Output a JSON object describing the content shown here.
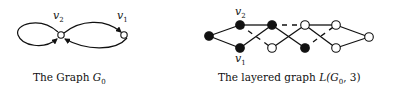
{
  "left_figure": {
    "caption_prefix": "The Graph ",
    "caption_math": "G",
    "caption_sub": "0",
    "nodes": [
      {
        "id": "v2",
        "label": "v",
        "sub": "2",
        "x": 61,
        "y": 35
      },
      {
        "id": "v1",
        "label": "v",
        "sub": "1",
        "x": 124,
        "y": 35
      }
    ],
    "edges": [
      {
        "from": "v2",
        "to": "v2",
        "type": "self-loop"
      },
      {
        "from": "v2",
        "to": "v1",
        "type": "arc-upper"
      },
      {
        "from": "v1",
        "to": "v2",
        "type": "arc-lower"
      }
    ]
  },
  "right_figure": {
    "caption_prefix": "The layered graph ",
    "caption_math": "L(G",
    "caption_sub": "0",
    "caption_suffix": ", 3)",
    "label_v2": {
      "label": "v",
      "sub": "2"
    },
    "label_v1": {
      "label": "v",
      "sub": "1"
    },
    "nodes": [
      {
        "id": "a",
        "x": 209,
        "y": 36,
        "filled": true
      },
      {
        "id": "b",
        "x": 240,
        "y": 25,
        "filled": true
      },
      {
        "id": "c",
        "x": 240,
        "y": 48,
        "filled": true
      },
      {
        "id": "d",
        "x": 272,
        "y": 25,
        "filled": true
      },
      {
        "id": "e",
        "x": 272,
        "y": 48,
        "filled": false
      },
      {
        "id": "f",
        "x": 305,
        "y": 25,
        "filled": false
      },
      {
        "id": "g",
        "x": 305,
        "y": 48,
        "filled": true
      },
      {
        "id": "h",
        "x": 336,
        "y": 25,
        "filled": false
      },
      {
        "id": "i",
        "x": 336,
        "y": 48,
        "filled": false
      },
      {
        "id": "j",
        "x": 369,
        "y": 37,
        "filled": false
      }
    ],
    "edges": [
      {
        "from": "a",
        "to": "b",
        "style": "solid"
      },
      {
        "from": "a",
        "to": "c",
        "style": "solid"
      },
      {
        "from": "b",
        "to": "d",
        "style": "solid"
      },
      {
        "from": "c",
        "to": "d",
        "style": "solid"
      },
      {
        "from": "b",
        "to": "e",
        "style": "dashed"
      },
      {
        "from": "d",
        "to": "f",
        "style": "dashed"
      },
      {
        "from": "d",
        "to": "g",
        "style": "solid"
      },
      {
        "from": "e",
        "to": "f",
        "style": "solid"
      },
      {
        "from": "f",
        "to": "h",
        "style": "solid"
      },
      {
        "from": "f",
        "to": "i",
        "style": "solid"
      },
      {
        "from": "g",
        "to": "h",
        "style": "dashed"
      },
      {
        "from": "h",
        "to": "j",
        "style": "solid"
      },
      {
        "from": "i",
        "to": "j",
        "style": "solid"
      }
    ]
  }
}
